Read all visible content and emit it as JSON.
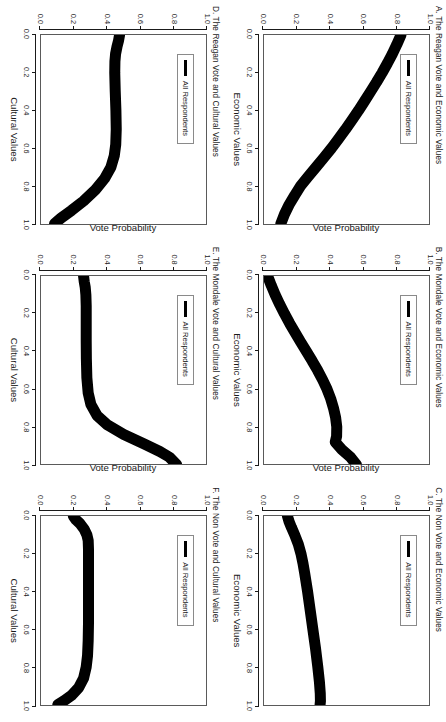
{
  "figure": {
    "legend_label": "All Respondents",
    "y_axis_title": "Vote Probability",
    "y_ticks": [
      "0.0",
      "0.2",
      "0.4",
      "0.6",
      "0.8",
      "1.0"
    ],
    "x_ticks": [
      "0.0",
      "0.2",
      "0.4",
      "0.6",
      "0.8",
      "1.0"
    ],
    "line_color": "#000000",
    "box_color": "#5a5a5a"
  },
  "chart_data": [
    {
      "id": "panel-a",
      "type": "line",
      "title": "A. The Reagan Vote and Economic Values",
      "xlabel": "Economic Values",
      "ylabel": "Vote Probability",
      "xlim": [
        0.0,
        1.0
      ],
      "ylim": [
        0.0,
        1.0
      ],
      "grid": false,
      "legend_position": "top-left",
      "series": [
        {
          "name": "All Respondents",
          "x": [
            0.0,
            0.05,
            0.1,
            0.15,
            0.2,
            0.25,
            0.3,
            0.35,
            0.4,
            0.45,
            0.5,
            0.55,
            0.6,
            0.65,
            0.7,
            0.75,
            0.8,
            0.85,
            0.9,
            0.95,
            1.0
          ],
          "y": [
            0.83,
            0.805,
            0.778,
            0.748,
            0.716,
            0.682,
            0.646,
            0.61,
            0.573,
            0.534,
            0.494,
            0.452,
            0.409,
            0.363,
            0.316,
            0.268,
            0.222,
            0.186,
            0.152,
            0.124,
            0.102
          ]
        }
      ]
    },
    {
      "id": "panel-b",
      "type": "line",
      "title": "B. The Mondale Vote and Economic Values",
      "xlabel": "Economic Values",
      "ylabel": "Vote Probability",
      "xlim": [
        0.0,
        1.0
      ],
      "ylim": [
        0.0,
        1.0
      ],
      "grid": false,
      "legend_position": "top-left",
      "series": [
        {
          "name": "All Respondents",
          "x": [
            0.0,
            0.05,
            0.1,
            0.15,
            0.2,
            0.25,
            0.3,
            0.35,
            0.4,
            0.45,
            0.5,
            0.55,
            0.6,
            0.65,
            0.7,
            0.75,
            0.8,
            0.85,
            0.88,
            0.92,
            0.96,
            1.0
          ],
          "y": [
            0.022,
            0.044,
            0.068,
            0.095,
            0.124,
            0.155,
            0.188,
            0.222,
            0.257,
            0.292,
            0.325,
            0.355,
            0.382,
            0.404,
            0.421,
            0.434,
            0.441,
            0.44,
            0.432,
            0.472,
            0.524,
            0.56
          ]
        }
      ]
    },
    {
      "id": "panel-c",
      "type": "line",
      "title": "C. The Non Vote and Economic Values",
      "xlabel": "Economic Values",
      "ylabel": "Vote Probability",
      "xlim": [
        0.0,
        1.0
      ],
      "ylim": [
        0.0,
        1.0
      ],
      "grid": false,
      "legend_position": "top-left",
      "series": [
        {
          "name": "All Respondents",
          "x": [
            0.0,
            0.03,
            0.06,
            0.1,
            0.15,
            0.2,
            0.25,
            0.3,
            0.4,
            0.5,
            0.6,
            0.7,
            0.8,
            0.88,
            0.94,
            0.98,
            1.0
          ],
          "y": [
            0.142,
            0.152,
            0.166,
            0.186,
            0.208,
            0.224,
            0.236,
            0.246,
            0.264,
            0.28,
            0.296,
            0.312,
            0.326,
            0.336,
            0.341,
            0.342,
            0.34
          ]
        }
      ]
    },
    {
      "id": "panel-d",
      "type": "line",
      "title": "D. The Reagan Vote and Cultural Values",
      "xlabel": "Cultural Values",
      "ylabel": "Vote Probability",
      "xlim": [
        0.0,
        1.0
      ],
      "ylim": [
        0.0,
        1.0
      ],
      "grid": false,
      "legend_position": "top-left",
      "series": [
        {
          "name": "All Respondents",
          "x": [
            0.0,
            0.03,
            0.06,
            0.1,
            0.14,
            0.2,
            0.3,
            0.4,
            0.5,
            0.58,
            0.64,
            0.7,
            0.76,
            0.82,
            0.88,
            0.93,
            0.97,
            1.0
          ],
          "y": [
            0.476,
            0.47,
            0.461,
            0.452,
            0.448,
            0.447,
            0.45,
            0.454,
            0.456,
            0.453,
            0.444,
            0.424,
            0.386,
            0.33,
            0.258,
            0.185,
            0.122,
            0.082
          ]
        }
      ]
    },
    {
      "id": "panel-e",
      "type": "line",
      "title": "E. The Mondale Vote and Cultural Values",
      "xlabel": "Cultural Values",
      "ylabel": "Vote Probability",
      "xlim": [
        0.0,
        1.0
      ],
      "ylim": [
        0.0,
        1.0
      ],
      "grid": false,
      "legend_position": "top-left",
      "series": [
        {
          "name": "All Respondents",
          "x": [
            0.0,
            0.03,
            0.06,
            0.1,
            0.16,
            0.24,
            0.34,
            0.44,
            0.54,
            0.62,
            0.68,
            0.74,
            0.79,
            0.84,
            0.89,
            0.93,
            0.96,
            1.0
          ],
          "y": [
            0.258,
            0.262,
            0.268,
            0.272,
            0.274,
            0.274,
            0.274,
            0.275,
            0.278,
            0.286,
            0.302,
            0.34,
            0.404,
            0.502,
            0.626,
            0.72,
            0.778,
            0.822
          ]
        }
      ]
    },
    {
      "id": "panel-f",
      "type": "line",
      "title": "F. The Non Vote and Cultural Values",
      "xlabel": "Cultural Values",
      "ylabel": "Vote Probability",
      "xlim": [
        0.0,
        1.0
      ],
      "ylim": [
        0.0,
        1.0
      ],
      "grid": false,
      "legend_position": "top-left",
      "series": [
        {
          "name": "All Respondents",
          "x": [
            0.0,
            0.02,
            0.04,
            0.07,
            0.1,
            0.13,
            0.18,
            0.26,
            0.36,
            0.46,
            0.56,
            0.66,
            0.74,
            0.8,
            0.86,
            0.91,
            0.95,
            0.98,
            1.0
          ],
          "y": [
            0.196,
            0.212,
            0.236,
            0.262,
            0.278,
            0.286,
            0.288,
            0.288,
            0.288,
            0.288,
            0.288,
            0.286,
            0.282,
            0.274,
            0.258,
            0.228,
            0.186,
            0.138,
            0.102
          ]
        }
      ]
    }
  ]
}
